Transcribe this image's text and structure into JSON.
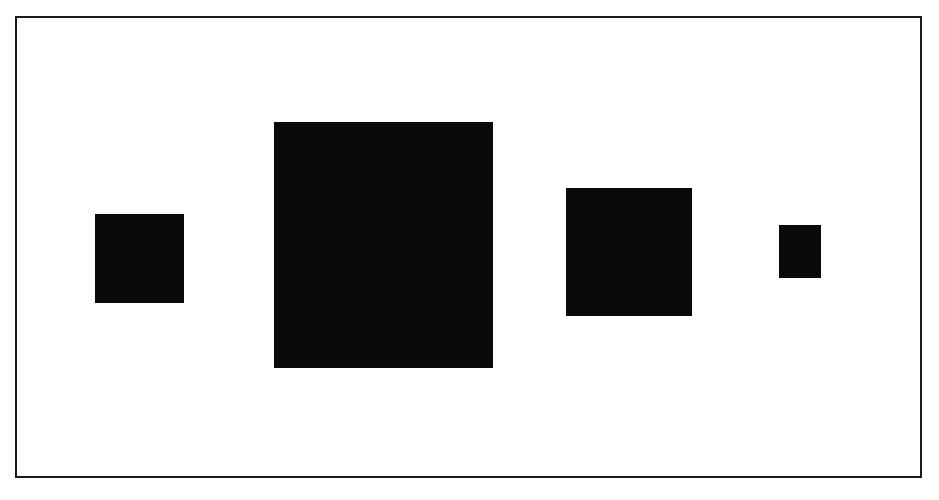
{
  "diagram": {
    "background": "#ffffff",
    "frame": {
      "left": 15,
      "top": 16,
      "width": 907,
      "height": 462,
      "color": "#1a1a1a"
    },
    "fill_color": "#0a0a0a",
    "squares": [
      {
        "id": "square-1",
        "left": 95,
        "top": 214,
        "width": 89,
        "height": 89
      },
      {
        "id": "square-2",
        "left": 274,
        "top": 122,
        "width": 219,
        "height": 246
      },
      {
        "id": "square-3",
        "left": 566,
        "top": 188,
        "width": 126,
        "height": 128
      },
      {
        "id": "square-4",
        "left": 779,
        "top": 225,
        "width": 42,
        "height": 53
      }
    ]
  }
}
